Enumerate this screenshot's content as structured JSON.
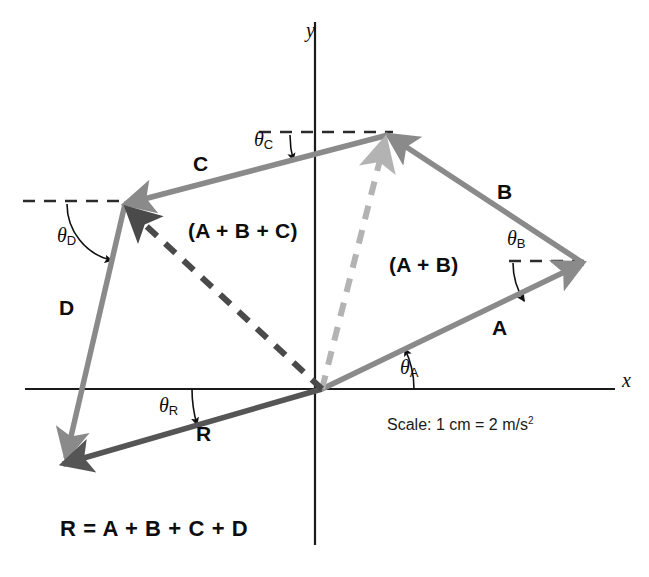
{
  "figure": {
    "scale_note": "Scale: 1 cm = 2 m/s",
    "scale_note_exponent": "2",
    "equation": "R = A + B + C + D",
    "background_color": "#ffffff"
  },
  "axes": {
    "x_label": "x",
    "y_label": "y",
    "color": "#1a1a1a",
    "origin": {
      "x": 322,
      "y": 389
    },
    "x_axis": {
      "x1": 25,
      "y1": 389,
      "x2": 615,
      "y2": 389
    },
    "y_axis": {
      "x1": 315,
      "y1": 22,
      "x2": 315,
      "y2": 545
    },
    "x_label_pos": {
      "x": 622,
      "y": 370
    },
    "y_label_pos": {
      "x": 306,
      "y": 20
    }
  },
  "colors": {
    "vector_gray": "#8a8a8a",
    "resultant_dark": "#555555",
    "dashed_dark": "#4a4a4a",
    "dashed_light": "#b3b3b3",
    "reference_dash": "#2b2b2b",
    "text": "#0d0d0d"
  },
  "vectors": [
    {
      "name": "A",
      "label": "A",
      "label_pos": {
        "x": 492,
        "y": 317
      },
      "from": {
        "x": 322,
        "y": 389
      },
      "to": {
        "x": 583,
        "y": 263
      },
      "style": "solid",
      "color": "#8a8a8a"
    },
    {
      "name": "B",
      "label": "B",
      "label_pos": {
        "x": 497,
        "y": 181
      },
      "from": {
        "x": 583,
        "y": 263
      },
      "to": {
        "x": 388,
        "y": 135
      },
      "style": "solid",
      "color": "#8a8a8a"
    },
    {
      "name": "C",
      "label": "C",
      "label_pos": {
        "x": 193,
        "y": 153
      },
      "from": {
        "x": 388,
        "y": 135
      },
      "to": {
        "x": 125,
        "y": 204
      },
      "style": "solid",
      "color": "#8a8a8a"
    },
    {
      "name": "D",
      "label": "D",
      "label_pos": {
        "x": 59,
        "y": 297
      },
      "from": {
        "x": 125,
        "y": 204
      },
      "to": {
        "x": 66,
        "y": 458
      },
      "style": "solid",
      "color": "#8a8a8a"
    },
    {
      "name": "R",
      "label": "R",
      "label_pos": {
        "x": 196,
        "y": 423
      },
      "from": {
        "x": 322,
        "y": 389
      },
      "to": {
        "x": 63,
        "y": 464
      },
      "style": "solid",
      "color": "#555555"
    },
    {
      "name": "A-plus-B",
      "label": "(A + B)",
      "label_pos": {
        "x": 389,
        "y": 254
      },
      "from": {
        "x": 322,
        "y": 389
      },
      "to": {
        "x": 385,
        "y": 140
      },
      "style": "dashed",
      "color": "#b3b3b3"
    },
    {
      "name": "A-plus-B-plus-C",
      "label": "(A + B + C)",
      "label_pos": {
        "x": 188,
        "y": 220
      },
      "from": {
        "x": 322,
        "y": 389
      },
      "to": {
        "x": 128,
        "y": 209
      },
      "style": "dashed",
      "color": "#4a4a4a"
    }
  ],
  "angles": [
    {
      "name": "theta-A",
      "theta": "θ",
      "subscript": "A",
      "label_pos": {
        "x": 400,
        "y": 357
      },
      "arc": {
        "cx": 322,
        "cy": 389,
        "r": 92,
        "start_deg": 0,
        "end_deg": 26
      }
    },
    {
      "name": "theta-B",
      "theta": "θ",
      "subscript": "B",
      "label_pos": {
        "x": 507,
        "y": 228
      },
      "arc": {
        "cx": 583,
        "cy": 263,
        "r": 70,
        "start_deg": 180,
        "end_deg": 213
      }
    },
    {
      "name": "theta-C",
      "theta": "θ",
      "subscript": "C",
      "label_pos": {
        "x": 254,
        "y": 129
      },
      "arc": {
        "cx": 388,
        "cy": 135,
        "r": 98,
        "start_deg": 180,
        "end_deg": 195
      }
    },
    {
      "name": "theta-D",
      "theta": "θ",
      "subscript": "D",
      "label_pos": {
        "x": 57,
        "y": 225
      },
      "arc": {
        "cx": 125,
        "cy": 204,
        "r": 58,
        "start_deg": 180,
        "end_deg": 257
      }
    },
    {
      "name": "theta-R",
      "theta": "θ",
      "subscript": "R",
      "label_pos": {
        "x": 159,
        "y": 395
      },
      "arc": {
        "cx": 322,
        "cy": 389,
        "r": 130,
        "start_deg": 180,
        "end_deg": 196
      }
    }
  ],
  "reference_lines": [
    {
      "name": "dash-ref-top-vertex",
      "x1": 259,
      "y1": 132,
      "x2": 393,
      "y2": 132
    },
    {
      "name": "dash-ref-left-vertex",
      "x1": 23,
      "y1": 201,
      "x2": 128,
      "y2": 201
    },
    {
      "name": "dash-ref-right-vertex",
      "x1": 509,
      "y1": 261,
      "x2": 588,
      "y2": 261
    }
  ]
}
